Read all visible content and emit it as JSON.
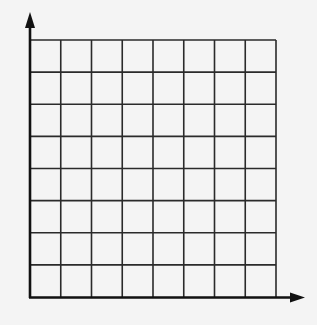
{
  "diagram": {
    "type": "blank-coordinate-grid",
    "columns": 8,
    "rows": 8,
    "axes": {
      "x_axis": {
        "arrow": true,
        "label": ""
      },
      "y_axis": {
        "arrow": true,
        "label": ""
      }
    },
    "colors": {
      "background": "#f4f4f4",
      "grid_line": "#2a2a2a",
      "axis_line": "#111111"
    }
  }
}
